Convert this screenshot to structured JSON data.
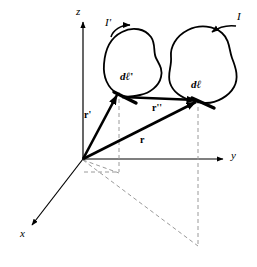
{
  "figure": {
    "background_color": "#ffffff",
    "stroke_color": "#000000",
    "dashed_color": "#8a8a8a",
    "width": 257,
    "height": 267
  },
  "axes": {
    "origin_label": "",
    "z": {
      "label": "z",
      "x": 76,
      "y": 7
    },
    "y": {
      "label": "y",
      "x": 232,
      "y": 151
    },
    "x": {
      "label": "x",
      "x": 22,
      "y": 232
    }
  },
  "loops": [
    {
      "name": "primed-loop",
      "current_label": "I'",
      "current_label_x": 107,
      "current_label_y": 19,
      "element_label_d": "d",
      "element_label_ell": "ℓ",
      "element_label_prime": "'",
      "element_label_x": 122,
      "element_label_y": 73
    },
    {
      "name": "unprimed-loop",
      "current_label": "I",
      "current_label_x": 238,
      "current_label_y": 12,
      "element_label_d": "d",
      "element_label_ell": "ℓ",
      "element_label_prime": "",
      "element_label_x": 192,
      "element_label_y": 81
    }
  ],
  "vectors": [
    {
      "name": "r-prime",
      "label_d": "r",
      "label_prime": "'",
      "label_x": 85,
      "label_y": 112,
      "description": "position vector from origin to source element d-ell-prime"
    },
    {
      "name": "r",
      "label_d": "r",
      "label_prime": "",
      "label_x": 141,
      "label_y": 137,
      "description": "position vector from origin to field element d-ell"
    },
    {
      "name": "r-double-prime",
      "label_d": "r",
      "label_prime": "''",
      "label_x": 153,
      "label_y": 105,
      "description": "separation vector from d-ell-prime to d-ell"
    }
  ]
}
